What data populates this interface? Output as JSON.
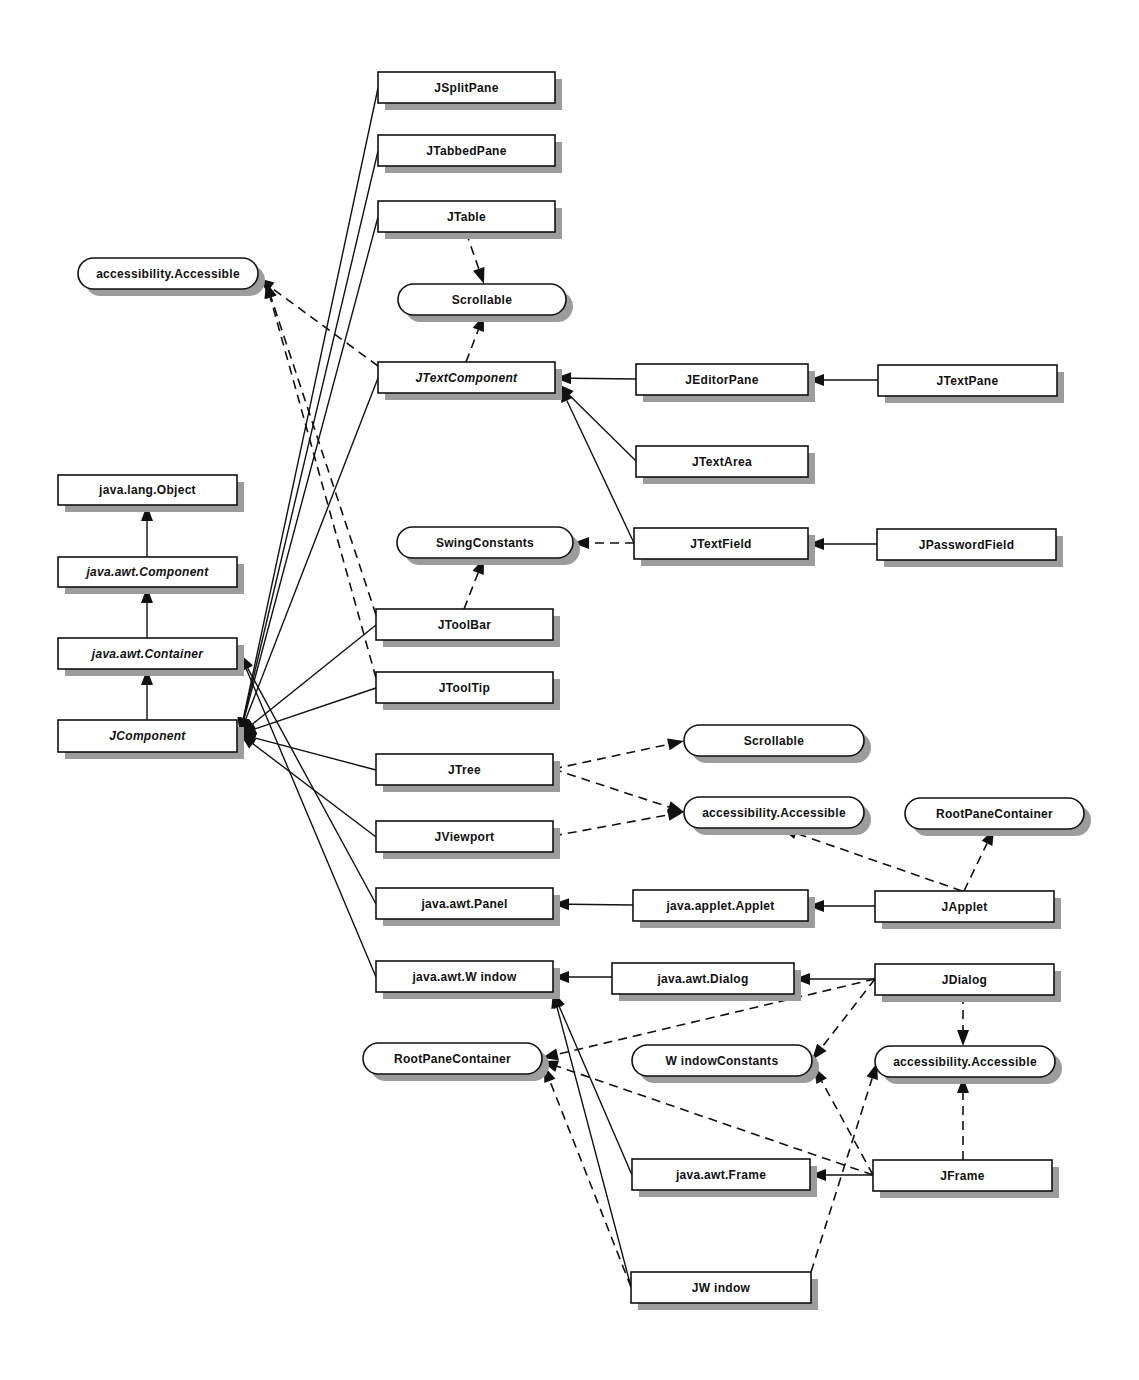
{
  "diagram": {
    "colors": {
      "stroke": "#111111",
      "shadow": "#9c9c9c",
      "fill": "#ffffff"
    },
    "nodes": [
      {
        "id": "JSplitPane",
        "label": "JSplitPane",
        "kind": "class",
        "italic": false,
        "x": 378,
        "y": 72,
        "w": 177,
        "h": 31
      },
      {
        "id": "JTabbedPane",
        "label": "JTabbedPane",
        "kind": "class",
        "italic": false,
        "x": 378,
        "y": 135,
        "w": 177,
        "h": 31
      },
      {
        "id": "JTable",
        "label": "JTable",
        "kind": "class",
        "italic": false,
        "x": 378,
        "y": 201,
        "w": 177,
        "h": 31
      },
      {
        "id": "Scrollable1",
        "label": "Scrollable",
        "kind": "interface",
        "italic": false,
        "x": 398,
        "y": 284,
        "w": 168,
        "h": 31
      },
      {
        "id": "Accessible1",
        "label": "accessibility.Accessible",
        "kind": "interface",
        "italic": false,
        "x": 78,
        "y": 258,
        "w": 180,
        "h": 31
      },
      {
        "id": "JTextComponent",
        "label": "JTextComponent",
        "kind": "class",
        "italic": true,
        "x": 378,
        "y": 362,
        "w": 177,
        "h": 31
      },
      {
        "id": "JEditorPane",
        "label": "JEditorPane",
        "kind": "class",
        "italic": false,
        "x": 636,
        "y": 364,
        "w": 172,
        "h": 31
      },
      {
        "id": "JTextPane",
        "label": "JTextPane",
        "kind": "class",
        "italic": false,
        "x": 878,
        "y": 365,
        "w": 179,
        "h": 31
      },
      {
        "id": "JTextArea",
        "label": "JTextArea",
        "kind": "class",
        "italic": false,
        "x": 636,
        "y": 446,
        "w": 172,
        "h": 31
      },
      {
        "id": "JTextField",
        "label": "JTextField",
        "kind": "class",
        "italic": false,
        "x": 634,
        "y": 528,
        "w": 174,
        "h": 31
      },
      {
        "id": "JPasswordField",
        "label": "JPasswordField",
        "kind": "class",
        "italic": false,
        "x": 877,
        "y": 529,
        "w": 179,
        "h": 31
      },
      {
        "id": "SwingConstants",
        "label": "SwingConstants",
        "kind": "interface",
        "italic": false,
        "x": 397,
        "y": 527,
        "w": 176,
        "h": 31
      },
      {
        "id": "Object",
        "label": "java.lang.Object",
        "kind": "class",
        "italic": false,
        "x": 58,
        "y": 475,
        "w": 179,
        "h": 30
      },
      {
        "id": "Component",
        "label": "java.awt.Component",
        "kind": "class",
        "italic": true,
        "x": 58,
        "y": 557,
        "w": 179,
        "h": 30
      },
      {
        "id": "Container",
        "label": "java.awt.Container",
        "kind": "class",
        "italic": true,
        "x": 58,
        "y": 638,
        "w": 179,
        "h": 31
      },
      {
        "id": "JComponent",
        "label": "JComponent",
        "kind": "class",
        "italic": true,
        "x": 58,
        "y": 720,
        "w": 179,
        "h": 32
      },
      {
        "id": "JToolBar",
        "label": "JToolBar",
        "kind": "class",
        "italic": false,
        "x": 376,
        "y": 609,
        "w": 177,
        "h": 31
      },
      {
        "id": "JToolTip",
        "label": "JToolTip",
        "kind": "class",
        "italic": false,
        "x": 376,
        "y": 672,
        "w": 177,
        "h": 31
      },
      {
        "id": "JTree",
        "label": "JTree",
        "kind": "class",
        "italic": false,
        "x": 376,
        "y": 754,
        "w": 177,
        "h": 31
      },
      {
        "id": "JViewport",
        "label": "JViewport",
        "kind": "class",
        "italic": false,
        "x": 376,
        "y": 821,
        "w": 177,
        "h": 31
      },
      {
        "id": "Panel",
        "label": "java.awt.Panel",
        "kind": "class",
        "italic": false,
        "x": 376,
        "y": 888,
        "w": 177,
        "h": 31
      },
      {
        "id": "Window",
        "label": "java.awt.W indow",
        "kind": "class",
        "italic": false,
        "x": 376,
        "y": 961,
        "w": 177,
        "h": 31
      },
      {
        "id": "Scrollable2",
        "label": "Scrollable",
        "kind": "interface",
        "italic": false,
        "x": 684,
        "y": 725,
        "w": 180,
        "h": 31
      },
      {
        "id": "Accessible2",
        "label": "accessibility.Accessible",
        "kind": "interface",
        "italic": false,
        "x": 684,
        "y": 797,
        "w": 180,
        "h": 31
      },
      {
        "id": "RootPane1",
        "label": "RootPaneContainer",
        "kind": "interface",
        "italic": false,
        "x": 905,
        "y": 798,
        "w": 179,
        "h": 31
      },
      {
        "id": "Applet",
        "label": "java.applet.Applet",
        "kind": "class",
        "italic": false,
        "x": 633,
        "y": 890,
        "w": 175,
        "h": 31
      },
      {
        "id": "JApplet",
        "label": "JApplet",
        "kind": "class",
        "italic": false,
        "x": 875,
        "y": 891,
        "w": 179,
        "h": 31
      },
      {
        "id": "Dialog",
        "label": "java.awt.Dialog",
        "kind": "class",
        "italic": false,
        "x": 612,
        "y": 963,
        "w": 182,
        "h": 31
      },
      {
        "id": "JDialog",
        "label": "JDialog",
        "kind": "class",
        "italic": false,
        "x": 875,
        "y": 964,
        "w": 179,
        "h": 31
      },
      {
        "id": "RootPane2",
        "label": "RootPaneContainer",
        "kind": "interface",
        "italic": false,
        "x": 363,
        "y": 1043,
        "w": 179,
        "h": 31
      },
      {
        "id": "WindowConstants",
        "label": "W indowConstants",
        "kind": "interface",
        "italic": false,
        "x": 632,
        "y": 1045,
        "w": 180,
        "h": 31
      },
      {
        "id": "Accessible3",
        "label": "accessibility.Accessible",
        "kind": "interface",
        "italic": false,
        "x": 875,
        "y": 1046,
        "w": 180,
        "h": 31
      },
      {
        "id": "Frame",
        "label": "java.awt.Frame",
        "kind": "class",
        "italic": false,
        "x": 632,
        "y": 1159,
        "w": 178,
        "h": 31
      },
      {
        "id": "JFrame",
        "label": "JFrame",
        "kind": "class",
        "italic": false,
        "x": 873,
        "y": 1160,
        "w": 179,
        "h": 31
      },
      {
        "id": "JWindow",
        "label": "JW indow",
        "kind": "class",
        "italic": false,
        "x": 631,
        "y": 1272,
        "w": 180,
        "h": 31
      }
    ],
    "edges": [
      {
        "from": [
          147,
          557
        ],
        "to": [
          147,
          505
        ],
        "style": "solid",
        "relation": "extends",
        "source": "Component",
        "target": "Object"
      },
      {
        "from": [
          147,
          638
        ],
        "to": [
          147,
          587
        ],
        "style": "solid",
        "relation": "extends",
        "source": "Container",
        "target": "Component"
      },
      {
        "from": [
          147,
          720
        ],
        "to": [
          147,
          669
        ],
        "style": "solid",
        "relation": "extends",
        "source": "JComponent",
        "target": "Container"
      },
      {
        "from": [
          378,
          88
        ],
        "to": [
          240,
          734
        ],
        "style": "solid",
        "relation": "extends",
        "source": "JSplitPane",
        "target": "JComponent"
      },
      {
        "from": [
          378,
          151
        ],
        "to": [
          240,
          734
        ],
        "style": "solid",
        "relation": "extends",
        "source": "JTabbedPane",
        "target": "JComponent"
      },
      {
        "from": [
          378,
          217
        ],
        "to": [
          240,
          734
        ],
        "style": "solid",
        "relation": "extends",
        "source": "JTable",
        "target": "JComponent"
      },
      {
        "from": [
          378,
          378
        ],
        "to": [
          240,
          734
        ],
        "style": "solid",
        "relation": "extends",
        "source": "JTextComponent",
        "target": "JComponent"
      },
      {
        "from": [
          376,
          625
        ],
        "to": [
          240,
          734
        ],
        "style": "solid",
        "relation": "extends",
        "source": "JToolBar",
        "target": "JComponent"
      },
      {
        "from": [
          376,
          688
        ],
        "to": [
          240,
          734
        ],
        "style": "solid",
        "relation": "extends",
        "source": "JToolTip",
        "target": "JComponent"
      },
      {
        "from": [
          376,
          770
        ],
        "to": [
          240,
          734
        ],
        "style": "solid",
        "relation": "extends",
        "source": "JTree",
        "target": "JComponent"
      },
      {
        "from": [
          376,
          837
        ],
        "to": [
          240,
          734
        ],
        "style": "solid",
        "relation": "extends",
        "source": "JViewport",
        "target": "JComponent"
      },
      {
        "from": [
          376,
          904
        ],
        "to": [
          240,
          654
        ],
        "style": "solid",
        "relation": "extends",
        "source": "Panel",
        "target": "Container"
      },
      {
        "from": [
          376,
          977
        ],
        "to": [
          240,
          654
        ],
        "style": "solid",
        "relation": "extends",
        "source": "Window",
        "target": "Container"
      },
      {
        "from": [
          466,
          232
        ],
        "to": [
          484,
          284
        ],
        "style": "dashed",
        "relation": "implements",
        "source": "JTable",
        "target": "Scrollable1"
      },
      {
        "from": [
          466,
          362
        ],
        "to": [
          484,
          315
        ],
        "style": "dashed",
        "relation": "implements",
        "source": "JTextComponent",
        "target": "Scrollable1"
      },
      {
        "from": [
          378,
          366
        ],
        "to": [
          258,
          278
        ],
        "style": "dashed",
        "relation": "implements",
        "source": "JTextComponent",
        "target": "Accessible1"
      },
      {
        "from": [
          376,
          615
        ],
        "to": [
          266,
          282
        ],
        "style": "dashed",
        "relation": "implements",
        "source": "JToolBar",
        "target": "Accessible1"
      },
      {
        "from": [
          376,
          678
        ],
        "to": [
          266,
          282
        ],
        "style": "dashed",
        "relation": "implements",
        "source": "JToolTip",
        "target": "Accessible1"
      },
      {
        "from": [
          636,
          379
        ],
        "to": [
          555,
          378
        ],
        "style": "solid",
        "relation": "extends",
        "source": "JEditorPane",
        "target": "JTextComponent"
      },
      {
        "from": [
          878,
          380
        ],
        "to": [
          808,
          380
        ],
        "style": "solid",
        "relation": "extends",
        "source": "JTextPane",
        "target": "JEditorPane"
      },
      {
        "from": [
          636,
          461
        ],
        "to": [
          558,
          384
        ],
        "style": "solid",
        "relation": "extends",
        "source": "JTextArea",
        "target": "JTextComponent"
      },
      {
        "from": [
          634,
          543
        ],
        "to": [
          560,
          386
        ],
        "style": "solid",
        "relation": "extends",
        "source": "JTextField",
        "target": "JTextComponent"
      },
      {
        "from": [
          877,
          544
        ],
        "to": [
          808,
          544
        ],
        "style": "solid",
        "relation": "extends",
        "source": "JPasswordField",
        "target": "JTextField"
      },
      {
        "from": [
          634,
          543
        ],
        "to": [
          573,
          543
        ],
        "style": "dashed",
        "relation": "implements",
        "source": "JTextField",
        "target": "SwingConstants"
      },
      {
        "from": [
          464,
          609
        ],
        "to": [
          484,
          558
        ],
        "style": "dashed",
        "relation": "implements",
        "source": "JToolBar",
        "target": "SwingConstants"
      },
      {
        "from": [
          553,
          769
        ],
        "to": [
          684,
          741
        ],
        "style": "dashed",
        "relation": "implements",
        "source": "JTree",
        "target": "Scrollable2"
      },
      {
        "from": [
          553,
          769
        ],
        "to": [
          684,
          812
        ],
        "style": "dashed",
        "relation": "implements",
        "source": "JTree",
        "target": "Accessible2"
      },
      {
        "from": [
          553,
          836
        ],
        "to": [
          684,
          812
        ],
        "style": "dashed",
        "relation": "implements",
        "source": "JViewport",
        "target": "Accessible2"
      },
      {
        "from": [
          962,
          891
        ],
        "to": [
          781,
          828
        ],
        "style": "dashed",
        "relation": "implements",
        "source": "JApplet",
        "target": "Accessible2"
      },
      {
        "from": [
          964,
          891
        ],
        "to": [
          994,
          829
        ],
        "style": "dashed",
        "relation": "implements",
        "source": "JApplet",
        "target": "RootPane1"
      },
      {
        "from": [
          633,
          905
        ],
        "to": [
          553,
          904
        ],
        "style": "solid",
        "relation": "extends",
        "source": "Applet",
        "target": "Panel"
      },
      {
        "from": [
          875,
          906
        ],
        "to": [
          808,
          906
        ],
        "style": "solid",
        "relation": "extends",
        "source": "JApplet",
        "target": "Applet"
      },
      {
        "from": [
          612,
          977
        ],
        "to": [
          553,
          977
        ],
        "style": "solid",
        "relation": "extends",
        "source": "Dialog",
        "target": "Window"
      },
      {
        "from": [
          875,
          979
        ],
        "to": [
          794,
          979
        ],
        "style": "solid",
        "relation": "extends",
        "source": "JDialog",
        "target": "Dialog"
      },
      {
        "from": [
          875,
          979
        ],
        "to": [
          542,
          1058
        ],
        "style": "dashed",
        "relation": "implements",
        "source": "JDialog",
        "target": "RootPane2"
      },
      {
        "from": [
          875,
          979
        ],
        "to": [
          812,
          1060
        ],
        "style": "dashed",
        "relation": "implements",
        "source": "JDialog",
        "target": "WindowConstants"
      },
      {
        "from": [
          963,
          995
        ],
        "to": [
          963,
          1046
        ],
        "style": "dashed",
        "relation": "implements",
        "source": "JDialog",
        "target": "Accessible3"
      },
      {
        "from": [
          632,
          1175
        ],
        "to": [
          553,
          992
        ],
        "style": "solid",
        "relation": "extends",
        "source": "Frame",
        "target": "Window"
      },
      {
        "from": [
          631,
          1287
        ],
        "to": [
          553,
          992
        ],
        "style": "solid",
        "relation": "extends",
        "source": "JWindow",
        "target": "Window"
      },
      {
        "from": [
          873,
          1175
        ],
        "to": [
          810,
          1175
        ],
        "style": "solid",
        "relation": "extends",
        "source": "JFrame",
        "target": "Frame"
      },
      {
        "from": [
          873,
          1175
        ],
        "to": [
          542,
          1061
        ],
        "style": "dashed",
        "relation": "implements",
        "source": "JFrame",
        "target": "RootPane2"
      },
      {
        "from": [
          873,
          1175
        ],
        "to": [
          814,
          1067
        ],
        "style": "dashed",
        "relation": "implements",
        "source": "JFrame",
        "target": "WindowConstants"
      },
      {
        "from": [
          963,
          1160
        ],
        "to": [
          963,
          1077
        ],
        "style": "dashed",
        "relation": "implements",
        "source": "JFrame",
        "target": "Accessible3"
      },
      {
        "from": [
          631,
          1287
        ],
        "to": [
          544,
          1066
        ],
        "style": "dashed",
        "relation": "implements",
        "source": "JWindow",
        "target": "RootPane2"
      },
      {
        "from": [
          811,
          1272
        ],
        "to": [
          877,
          1063
        ],
        "style": "dashed",
        "relation": "implements",
        "source": "JWindow",
        "target": "Accessible3"
      }
    ]
  }
}
